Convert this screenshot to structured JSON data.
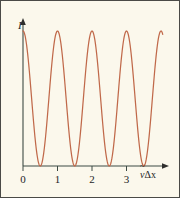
{
  "figure": {
    "background_color": "#fbf8ec",
    "border_color": "#4a4a46",
    "axis_color": "#3d4a44",
    "curve_color": "#c0694a"
  },
  "axes": {
    "y_label": "I",
    "x_label_symbol": "ν",
    "x_label_tilde": "~",
    "x_label_rest": "Δx",
    "x_ticks": [
      "0",
      "1",
      "2",
      "3"
    ]
  },
  "chart_data": {
    "type": "line",
    "title": "",
    "xlabel": "ν̃Δx",
    "ylabel": "I",
    "xlim": [
      0,
      4.05
    ],
    "ylim": [
      0,
      1.05
    ],
    "grid": false,
    "legend": "none",
    "xticks": [
      0,
      1,
      2,
      3
    ],
    "xticklabels": [
      "0",
      "1",
      "2",
      "3"
    ],
    "yticks": [],
    "yticklabels": [],
    "series": [
      {
        "name": "I = cos^2(pi * nu~ * dx)",
        "formula": "cos^2(pi*x)",
        "maxima_x": [
          0,
          1,
          2,
          3,
          4
        ],
        "maxima_y": [
          1,
          1,
          1,
          1,
          1
        ],
        "minima_x": [
          0.5,
          1.5,
          2.5,
          3.5
        ],
        "minima_y": [
          0,
          0,
          0,
          0
        ],
        "x": [
          0,
          0.1,
          0.2,
          0.3,
          0.4,
          0.5,
          0.6,
          0.7,
          0.8,
          0.9,
          1.0,
          1.1,
          1.2,
          1.3,
          1.4,
          1.5,
          1.6,
          1.7,
          1.8,
          1.9,
          2.0,
          2.1,
          2.2,
          2.3,
          2.4,
          2.5,
          2.6,
          2.7,
          2.8,
          2.9,
          3.0,
          3.1,
          3.2,
          3.3,
          3.4,
          3.5,
          3.6,
          3.7,
          3.8,
          3.9,
          4.0
        ],
        "values": [
          1.0,
          0.905,
          0.655,
          0.345,
          0.095,
          0.0,
          0.095,
          0.345,
          0.655,
          0.905,
          1.0,
          0.905,
          0.655,
          0.345,
          0.095,
          0.0,
          0.095,
          0.345,
          0.655,
          0.905,
          1.0,
          0.905,
          0.655,
          0.345,
          0.095,
          0.0,
          0.095,
          0.345,
          0.655,
          0.905,
          1.0,
          0.905,
          0.655,
          0.345,
          0.095,
          0.0,
          0.095,
          0.345,
          0.655,
          0.905,
          1.0
        ]
      }
    ]
  }
}
